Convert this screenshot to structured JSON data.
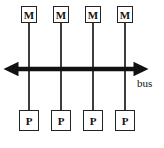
{
  "diagram": {
    "memory_modules": [
      {
        "label": "M"
      },
      {
        "label": "M"
      },
      {
        "label": "M"
      },
      {
        "label": "M"
      }
    ],
    "processors": [
      {
        "label": "P"
      },
      {
        "label": "P"
      },
      {
        "label": "P"
      },
      {
        "label": "P"
      }
    ],
    "bus": {
      "label": "bus"
    },
    "colors": {
      "background": "#ffffff",
      "box_border": "#222222",
      "connector": "#3d3d3d",
      "bus_arrow": "#111111",
      "text": "#111111"
    }
  }
}
